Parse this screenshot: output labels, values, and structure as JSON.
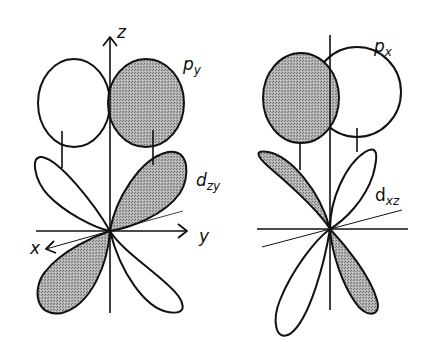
{
  "colors": {
    "stroke": "#111111",
    "shade": "#a8a8a8",
    "background": "#ffffff"
  },
  "left_diagram": {
    "axes": {
      "z": "z",
      "y": "y",
      "x": "x"
    },
    "orbitals": [
      {
        "name": "p",
        "sub": "y",
        "shading": "right lobe shaded"
      },
      {
        "name": "d",
        "sub": "zy",
        "shading": "upper-right and lower-left lobes shaded"
      }
    ]
  },
  "right_diagram": {
    "orbitals": [
      {
        "name": "p",
        "sub": "x",
        "shading": "left lobe shaded"
      },
      {
        "name": "d",
        "sub": "xz",
        "shading": "upper-left and lower-right lobes shaded"
      }
    ]
  }
}
